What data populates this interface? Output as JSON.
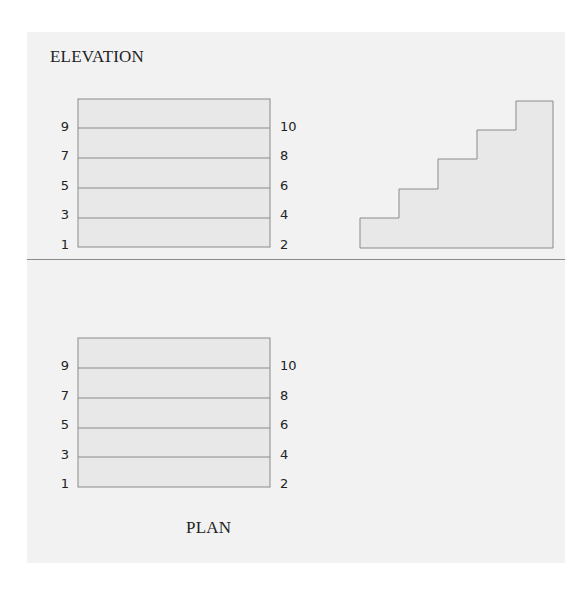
{
  "elevation": {
    "title": "ELEVATION",
    "left_labels": [
      "9",
      "7",
      "5",
      "3",
      "1"
    ],
    "right_labels": [
      "10",
      "8",
      "6",
      "4",
      "2"
    ]
  },
  "plan": {
    "title": "PLAN",
    "left_labels": [
      "9",
      "7",
      "5",
      "3",
      "1"
    ],
    "right_labels": [
      "10",
      "8",
      "6",
      "4",
      "2"
    ]
  },
  "colors": {
    "panel_bg": "#f2f2f2",
    "shape_fill": "#e8e8e8",
    "stroke": "#8a8a8a"
  }
}
